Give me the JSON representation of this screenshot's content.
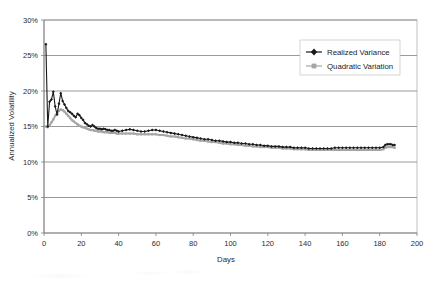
{
  "chart_data": {
    "type": "line",
    "title": "",
    "xlabel": "Days",
    "ylabel": "Annualized Volatility",
    "xlim": [
      0,
      200
    ],
    "ylim": [
      0,
      0.3
    ],
    "grid": true,
    "grid_axis": "y",
    "legend_position": "top-right",
    "x_tick_labels": [
      "0",
      "20",
      "40",
      "60",
      "80",
      "100",
      "120",
      "140",
      "160",
      "180",
      "200"
    ],
    "x_ticks": [
      0,
      20,
      40,
      60,
      80,
      100,
      120,
      140,
      160,
      180,
      200
    ],
    "y_tick_labels": [
      "0%",
      "5%",
      "10%",
      "15%",
      "20%",
      "25%",
      "30%"
    ],
    "y_ticks": [
      0,
      0.05,
      0.1,
      0.15,
      0.2,
      0.25,
      0.3
    ],
    "series": [
      {
        "name": "Realized Variance",
        "color": "#1a1a1a",
        "marker": "diamond",
        "x": [
          1,
          2,
          3,
          4,
          5,
          6,
          7,
          8,
          9,
          10,
          11,
          12,
          13,
          14,
          15,
          16,
          17,
          18,
          19,
          20,
          21,
          22,
          23,
          24,
          25,
          26,
          27,
          28,
          29,
          30,
          31,
          32,
          33,
          34,
          35,
          36,
          37,
          38,
          39,
          40,
          42,
          44,
          46,
          48,
          50,
          52,
          54,
          56,
          58,
          60,
          62,
          64,
          66,
          68,
          70,
          72,
          74,
          76,
          78,
          80,
          82,
          84,
          86,
          88,
          90,
          92,
          94,
          96,
          98,
          100,
          102,
          104,
          106,
          108,
          110,
          112,
          114,
          116,
          118,
          120,
          122,
          124,
          126,
          128,
          130,
          132,
          134,
          136,
          138,
          140,
          142,
          144,
          146,
          148,
          150,
          152,
          154,
          156,
          158,
          160,
          162,
          164,
          166,
          168,
          170,
          172,
          174,
          176,
          178,
          180,
          182,
          183,
          184,
          185,
          186,
          187,
          188
        ],
        "values": [
          0.266,
          0.15,
          0.185,
          0.188,
          0.199,
          0.178,
          0.167,
          0.182,
          0.197,
          0.186,
          0.181,
          0.176,
          0.172,
          0.17,
          0.168,
          0.165,
          0.163,
          0.168,
          0.166,
          0.162,
          0.159,
          0.155,
          0.153,
          0.151,
          0.15,
          0.152,
          0.15,
          0.148,
          0.147,
          0.147,
          0.146,
          0.147,
          0.146,
          0.145,
          0.145,
          0.144,
          0.144,
          0.145,
          0.144,
          0.143,
          0.144,
          0.145,
          0.146,
          0.145,
          0.144,
          0.143,
          0.143,
          0.144,
          0.145,
          0.145,
          0.144,
          0.143,
          0.142,
          0.141,
          0.14,
          0.139,
          0.138,
          0.137,
          0.136,
          0.135,
          0.134,
          0.133,
          0.132,
          0.132,
          0.131,
          0.13,
          0.13,
          0.129,
          0.128,
          0.128,
          0.127,
          0.127,
          0.126,
          0.126,
          0.125,
          0.125,
          0.124,
          0.124,
          0.123,
          0.123,
          0.122,
          0.122,
          0.122,
          0.121,
          0.121,
          0.121,
          0.12,
          0.12,
          0.12,
          0.12,
          0.119,
          0.119,
          0.119,
          0.119,
          0.119,
          0.119,
          0.119,
          0.12,
          0.12,
          0.12,
          0.12,
          0.12,
          0.12,
          0.12,
          0.12,
          0.12,
          0.12,
          0.12,
          0.12,
          0.12,
          0.121,
          0.124,
          0.125,
          0.125,
          0.125,
          0.124,
          0.124
        ]
      },
      {
        "name": "Quadratic Variation",
        "color": "#a6a6a6",
        "marker": "square",
        "x": [
          1,
          2,
          3,
          4,
          5,
          6,
          7,
          8,
          9,
          10,
          11,
          12,
          13,
          14,
          15,
          16,
          17,
          18,
          19,
          20,
          21,
          22,
          23,
          24,
          25,
          26,
          27,
          28,
          29,
          30,
          31,
          32,
          33,
          34,
          35,
          36,
          37,
          38,
          39,
          40,
          42,
          44,
          46,
          48,
          50,
          52,
          54,
          56,
          58,
          60,
          62,
          64,
          66,
          68,
          70,
          72,
          74,
          76,
          78,
          80,
          82,
          84,
          86,
          88,
          90,
          92,
          94,
          96,
          98,
          100,
          102,
          104,
          106,
          108,
          110,
          112,
          114,
          116,
          118,
          120,
          122,
          124,
          126,
          128,
          130,
          132,
          134,
          136,
          138,
          140,
          142,
          144,
          146,
          148,
          150,
          152,
          154,
          156,
          158,
          160,
          162,
          164,
          166,
          168,
          170,
          172,
          174,
          176,
          178,
          180,
          182,
          183,
          184,
          185,
          186,
          187,
          188
        ],
        "values": [
          0.15,
          0.149,
          0.152,
          0.156,
          0.16,
          0.165,
          0.169,
          0.172,
          0.174,
          0.173,
          0.171,
          0.168,
          0.165,
          0.162,
          0.159,
          0.157,
          0.155,
          0.153,
          0.151,
          0.15,
          0.149,
          0.148,
          0.147,
          0.146,
          0.145,
          0.145,
          0.144,
          0.144,
          0.143,
          0.143,
          0.143,
          0.142,
          0.142,
          0.142,
          0.141,
          0.141,
          0.141,
          0.141,
          0.14,
          0.14,
          0.14,
          0.14,
          0.14,
          0.14,
          0.139,
          0.139,
          0.139,
          0.139,
          0.139,
          0.139,
          0.138,
          0.138,
          0.137,
          0.136,
          0.136,
          0.135,
          0.134,
          0.133,
          0.133,
          0.132,
          0.131,
          0.13,
          0.13,
          0.129,
          0.128,
          0.128,
          0.127,
          0.126,
          0.126,
          0.125,
          0.125,
          0.124,
          0.124,
          0.123,
          0.123,
          0.122,
          0.122,
          0.121,
          0.121,
          0.121,
          0.12,
          0.12,
          0.12,
          0.119,
          0.119,
          0.119,
          0.118,
          0.118,
          0.118,
          0.118,
          0.117,
          0.117,
          0.117,
          0.117,
          0.117,
          0.117,
          0.117,
          0.117,
          0.117,
          0.117,
          0.117,
          0.117,
          0.117,
          0.117,
          0.117,
          0.117,
          0.117,
          0.117,
          0.117,
          0.117,
          0.118,
          0.12,
          0.121,
          0.121,
          0.121,
          0.121,
          0.12
        ]
      }
    ]
  },
  "colors": {
    "realized_variance": "#1a1a1a",
    "quadratic_variation": "#a6a6a6",
    "gridline": "#808080",
    "axis": "#808080",
    "plot_border": "#b0b0b0",
    "background": "#ffffff"
  }
}
